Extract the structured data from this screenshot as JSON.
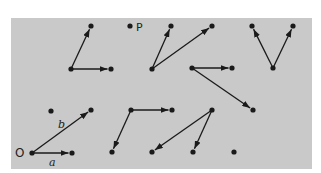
{
  "diagram": {
    "background": "#c9c9c9",
    "ink": "#1a1a1a",
    "labels": {
      "origin": "O",
      "point": "P",
      "vec_a": "a",
      "vec_b": "b"
    },
    "dots": [
      {
        "x": 91,
        "y": 26
      },
      {
        "x": 71,
        "y": 69
      },
      {
        "x": 111,
        "y": 69
      },
      {
        "x": 130,
        "y": 26
      },
      {
        "x": 171,
        "y": 26
      },
      {
        "x": 212,
        "y": 26
      },
      {
        "x": 152,
        "y": 69
      },
      {
        "x": 192,
        "y": 68
      },
      {
        "x": 232,
        "y": 68
      },
      {
        "x": 253,
        "y": 110
      },
      {
        "x": 252,
        "y": 26
      },
      {
        "x": 293,
        "y": 26
      },
      {
        "x": 273,
        "y": 68
      },
      {
        "x": 51,
        "y": 111
      },
      {
        "x": 91,
        "y": 110
      },
      {
        "x": 32,
        "y": 153
      },
      {
        "x": 72,
        "y": 153
      },
      {
        "x": 131,
        "y": 110
      },
      {
        "x": 172,
        "y": 110
      },
      {
        "x": 112,
        "y": 152
      },
      {
        "x": 212,
        "y": 110
      },
      {
        "x": 152,
        "y": 152
      },
      {
        "x": 193,
        "y": 152
      },
      {
        "x": 234,
        "y": 152
      }
    ],
    "arrows": [
      {
        "x1": 71,
        "y1": 69,
        "x2": 91,
        "y2": 26
      },
      {
        "x1": 71,
        "y1": 69,
        "x2": 111,
        "y2": 69
      },
      {
        "x1": 152,
        "y1": 69,
        "x2": 171,
        "y2": 26
      },
      {
        "x1": 152,
        "y1": 69,
        "x2": 212,
        "y2": 26
      },
      {
        "x1": 192,
        "y1": 68,
        "x2": 232,
        "y2": 68
      },
      {
        "x1": 192,
        "y1": 68,
        "x2": 253,
        "y2": 110
      },
      {
        "x1": 273,
        "y1": 68,
        "x2": 252,
        "y2": 26
      },
      {
        "x1": 273,
        "y1": 68,
        "x2": 293,
        "y2": 26
      },
      {
        "x1": 32,
        "y1": 153,
        "x2": 91,
        "y2": 110
      },
      {
        "x1": 32,
        "y1": 153,
        "x2": 72,
        "y2": 153
      },
      {
        "x1": 131,
        "y1": 110,
        "x2": 172,
        "y2": 110
      },
      {
        "x1": 131,
        "y1": 110,
        "x2": 112,
        "y2": 152
      },
      {
        "x1": 212,
        "y1": 110,
        "x2": 152,
        "y2": 152
      },
      {
        "x1": 212,
        "y1": 110,
        "x2": 193,
        "y2": 152
      }
    ]
  }
}
